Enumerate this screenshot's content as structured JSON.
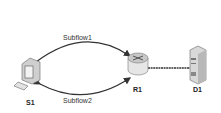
{
  "nodes": {
    "s1": {
      "label": "S1",
      "type": "workstation"
    },
    "r1": {
      "label": "R1",
      "type": "router"
    },
    "d1": {
      "label": "D1",
      "type": "server"
    }
  },
  "links": {
    "subflow1": {
      "label": "Subflow1",
      "from": "S1",
      "to": "R1"
    },
    "subflow2": {
      "label": "Subflow2",
      "from": "S1",
      "to": "R1"
    },
    "r1_d1": {
      "from": "R1",
      "to": "D1"
    }
  },
  "colors": {
    "line": "#333333",
    "device": "#dcdcdc",
    "device_dark": "#9a9a9a"
  }
}
